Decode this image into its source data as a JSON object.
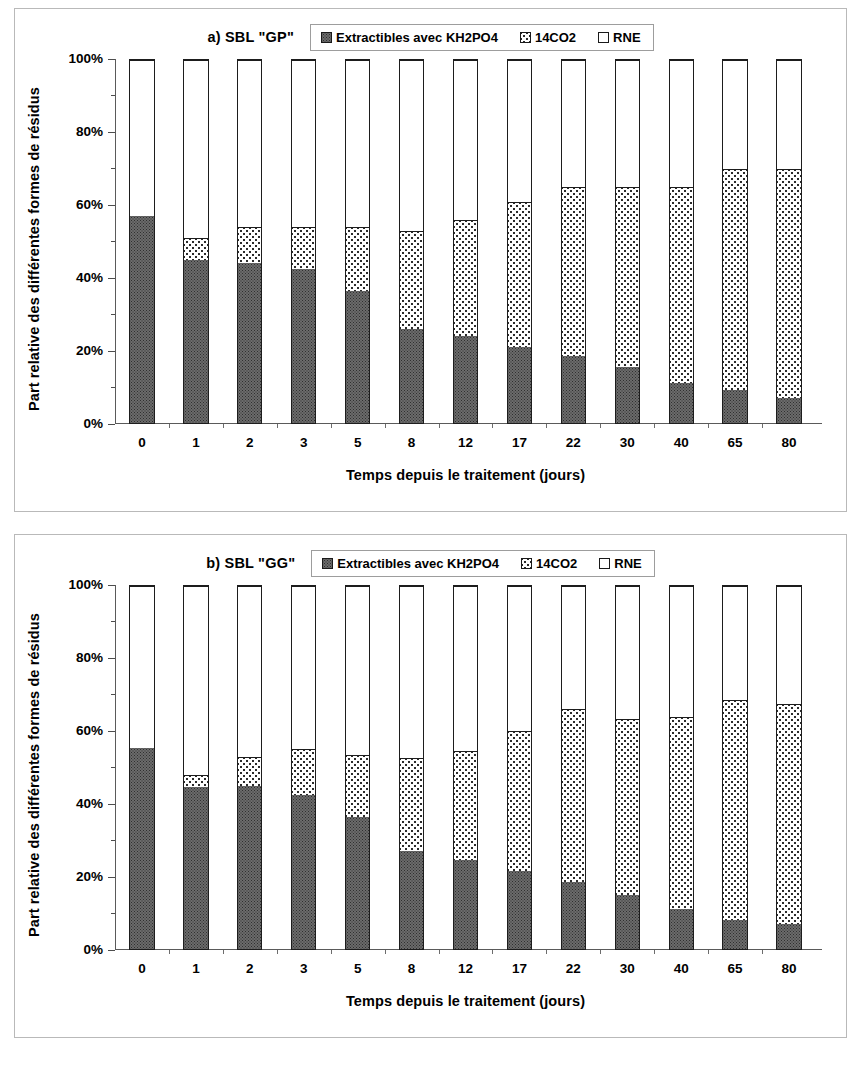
{
  "panels": [
    {
      "title": "a) SBL \"GP\"",
      "legend": [
        {
          "label": "Extractibles avec KH2PO4",
          "pattern": "dark-dotted",
          "color": "#6b6b6b"
        },
        {
          "label": "14CO2",
          "pattern": "sparse-dots",
          "color": "#ffffff"
        },
        {
          "label": "RNE",
          "pattern": "plain-white",
          "color": "#ffffff"
        }
      ],
      "ylabel": "Part relative des différentes formes de résidus",
      "xlabel": "Temps depuis le traitement (jours)",
      "yticks": [
        "0%",
        "20%",
        "40%",
        "60%",
        "80%",
        "100%"
      ]
    },
    {
      "title": "b) SBL \"GG\"",
      "legend": [
        {
          "label": "Extractibles avec KH2PO4",
          "pattern": "dark-dotted",
          "color": "#6b6b6b"
        },
        {
          "label": "14CO2",
          "pattern": "sparse-dots",
          "color": "#ffffff"
        },
        {
          "label": "RNE",
          "pattern": "plain-white",
          "color": "#ffffff"
        }
      ],
      "ylabel": "Part relative des différentes formes de résidus",
      "xlabel": "Temps depuis le traitement (jours)",
      "yticks": [
        "0%",
        "20%",
        "40%",
        "60%",
        "80%",
        "100%"
      ]
    }
  ],
  "chart_data": [
    {
      "type": "bar",
      "stacked": true,
      "title": "a) SBL \"GP\"",
      "xlabel": "Temps depuis le traitement (jours)",
      "ylabel": "Part relative des différentes formes de résidus",
      "ylim": [
        0,
        100
      ],
      "yticks": [
        0,
        20,
        40,
        60,
        80,
        100
      ],
      "ytick_labels": [
        "0%",
        "20%",
        "40%",
        "60%",
        "80%",
        "100%"
      ],
      "grid": false,
      "legend_position": "top-center",
      "categories": [
        "0",
        "1",
        "2",
        "3",
        "5",
        "8",
        "12",
        "17",
        "22",
        "30",
        "40",
        "65",
        "80"
      ],
      "series": [
        {
          "name": "Extractibles avec KH2PO4",
          "values": [
            57,
            45,
            44,
            42.5,
            36.5,
            26,
            24,
            21,
            18.5,
            15.5,
            11,
            9,
            7
          ]
        },
        {
          "name": "14CO2",
          "values": [
            0,
            6,
            10,
            11.5,
            17.5,
            27,
            32,
            40,
            46.5,
            49.5,
            54,
            61,
            63
          ]
        },
        {
          "name": "RNE",
          "values": [
            43,
            49,
            46,
            46,
            46,
            47,
            44,
            39,
            35,
            35,
            35,
            30,
            30
          ]
        }
      ],
      "cumulative_tops": {
        "extractibles": [
          57,
          45,
          44,
          42.5,
          36.5,
          26,
          24,
          21,
          18.5,
          15.5,
          11,
          9,
          7
        ],
        "co2": [
          57,
          51,
          54,
          54,
          54,
          53,
          56,
          61,
          65,
          65,
          65,
          70,
          70
        ],
        "rne": [
          100,
          100,
          100,
          100,
          100,
          100,
          100,
          100,
          100,
          100,
          100,
          100,
          100
        ]
      }
    },
    {
      "type": "bar",
      "stacked": true,
      "title": "b) SBL \"GG\"",
      "xlabel": "Temps depuis le traitement (jours)",
      "ylabel": "Part relative des différentes formes de résidus",
      "ylim": [
        0,
        100
      ],
      "yticks": [
        0,
        20,
        40,
        60,
        80,
        100
      ],
      "ytick_labels": [
        "0%",
        "20%",
        "40%",
        "60%",
        "80%",
        "100%"
      ],
      "grid": false,
      "legend_position": "top-center",
      "categories": [
        "0",
        "1",
        "2",
        "3",
        "5",
        "8",
        "12",
        "17",
        "22",
        "30",
        "40",
        "65",
        "80"
      ],
      "series": [
        {
          "name": "Extractibles avec KH2PO4",
          "values": [
            55.5,
            44.5,
            45,
            42.5,
            36.5,
            27,
            24.5,
            21.5,
            18.5,
            15,
            11,
            8,
            7
          ]
        },
        {
          "name": "14CO2",
          "values": [
            0,
            3.5,
            8,
            12.5,
            17,
            25.5,
            30,
            38.5,
            47.5,
            48.5,
            53,
            60.5,
            60.5
          ]
        },
        {
          "name": "RNE",
          "values": [
            44.5,
            52,
            47,
            45,
            46.5,
            47.5,
            45.5,
            40,
            34,
            36.5,
            36,
            31.5,
            32.5
          ]
        }
      ],
      "cumulative_tops": {
        "extractibles": [
          55.5,
          44.5,
          45,
          42.5,
          36.5,
          27,
          24.5,
          21.5,
          18.5,
          15,
          11,
          8,
          7
        ],
        "co2": [
          55.5,
          48,
          53,
          55,
          53.5,
          52.5,
          54.5,
          60,
          66,
          63.5,
          64,
          68.5,
          67.5
        ],
        "rne": [
          100,
          100,
          100,
          100,
          100,
          100,
          100,
          100,
          100,
          100,
          100,
          100,
          100
        ]
      }
    }
  ]
}
